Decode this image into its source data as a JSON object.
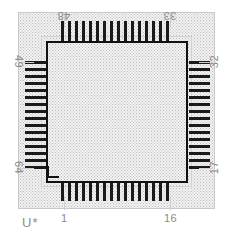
{
  "drawing": {
    "title": "QFP-64 PCB land pattern",
    "package": "QFP-64",
    "reference_designator": "U*",
    "pad_count_total": 64,
    "pads_per_side": 16,
    "colors": {
      "pad": "#1a1a1a",
      "body_outline": "#111111",
      "courtyard_outline": "#c9c9c9",
      "assembly_outline": "#d2d2d2",
      "label_text": "#8a8a8a",
      "refdes_text": "#8d8d8d",
      "hatch_background": "#f2f2f2",
      "hatch_dots": "#bdbdbd",
      "page_background": "#ffffff"
    }
  },
  "pin_labels": {
    "top_left": "48",
    "top_right": "33",
    "right_top": "32",
    "right_bottom": "17",
    "bottom_right": "16",
    "bottom_left": "1",
    "left_bottom": "64",
    "left_top": "49"
  },
  "sides": {
    "top": {
      "start_pin": "48",
      "end_pin": "33",
      "count": 16,
      "orientation": "vertical-pads"
    },
    "right": {
      "start_pin": "32",
      "end_pin": "17",
      "count": 16,
      "orientation": "horizontal-pads"
    },
    "bottom": {
      "start_pin": "1",
      "end_pin": "16",
      "count": 16,
      "orientation": "vertical-pads"
    },
    "left": {
      "start_pin": "49",
      "end_pin": "64",
      "count": 16,
      "orientation": "horizontal-pads"
    }
  },
  "pads": {
    "top": [
      1,
      2,
      3,
      4,
      5,
      6,
      7,
      8,
      9,
      10,
      11,
      12,
      13,
      14,
      15,
      16
    ],
    "bottom": [
      1,
      2,
      3,
      4,
      5,
      6,
      7,
      8,
      9,
      10,
      11,
      12,
      13,
      14,
      15,
      16
    ],
    "left": [
      1,
      2,
      3,
      4,
      5,
      6,
      7,
      8,
      9,
      10,
      11,
      12,
      13,
      14,
      15,
      16
    ],
    "right": [
      1,
      2,
      3,
      4,
      5,
      6,
      7,
      8,
      9,
      10,
      11,
      12,
      13,
      14,
      15,
      16
    ]
  }
}
